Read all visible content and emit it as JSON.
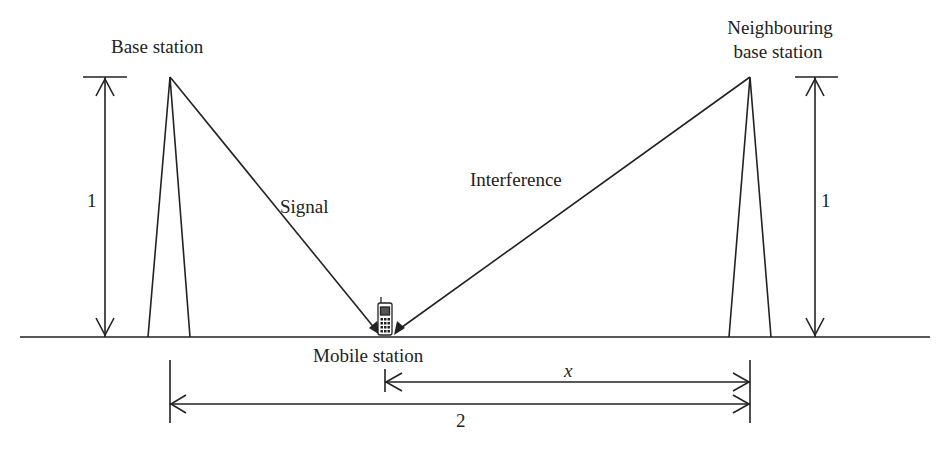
{
  "labels": {
    "base_station": "Base station",
    "neighbouring_line1": "Neighbouring",
    "neighbouring_line2": "base station",
    "signal": "Signal",
    "interference": "Interference",
    "mobile_station": "Mobile station",
    "height_left": "1",
    "height_right": "1",
    "distance_x": "x",
    "distance_total": "2"
  },
  "colors": {
    "line": "#222222",
    "background": "#ffffff"
  }
}
